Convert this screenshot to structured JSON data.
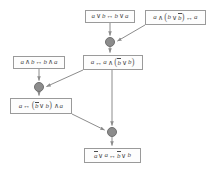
{
  "diagram": {
    "type": "proof-derivation-graph",
    "background_color": "#ffffff",
    "box_border_color": "#9a9a9a",
    "box_fill_color": "#fdfdfd",
    "text_color": "#4a4a4a",
    "node_fill_color": "#8c8c8c",
    "node_border_color": "#6f6f6f",
    "edge_color": "#8c8c8c",
    "formulas": {
      "f1": "a ∨ b ↔ b ∨ a",
      "f2": "a ∧ (b ∨ b̄) ↔ a",
      "f3": "a ↔ a ∧ (b̄ ∨ b)",
      "f4": "a ∧ b ↔ b ∧ a",
      "f5": "a ↔ (b̄ ∨ b) ∧ a",
      "f6": "ā ∨ a ↔ b̄ ∨ b"
    },
    "nodes": [
      {
        "id": "f1",
        "name": "formula-box-avb-bva",
        "label": "a ∨ b ↔ b ∨ a",
        "x": 85,
        "y": 10,
        "w": 50,
        "h": 13
      },
      {
        "id": "f2",
        "name": "formula-box-a-and-bvnb",
        "label": "a ∧ (b ∨ b̄) ↔ a",
        "x": 145,
        "y": 10,
        "w": 61,
        "h": 15
      },
      {
        "id": "f3",
        "name": "formula-box-a-iff-a-and",
        "label": "a ↔ a ∧ (b̄ ∨ b)",
        "x": 83,
        "y": 55,
        "w": 60,
        "h": 15
      },
      {
        "id": "f4",
        "name": "formula-box-aandb-banda",
        "label": "a ∧ b ↔ b ∧ a",
        "x": 13,
        "y": 56,
        "w": 52,
        "h": 13
      },
      {
        "id": "f5",
        "name": "formula-box-a-iff-nbvb-and",
        "label": "a ↔ (b̄ ∨ b) ∧ a",
        "x": 10,
        "y": 98,
        "w": 62,
        "h": 16
      },
      {
        "id": "f6",
        "name": "formula-box-nava-nbvb",
        "label": "ā ∨ a ↔ b̄ ∨ b",
        "x": 84,
        "y": 148,
        "w": 57,
        "h": 15
      }
    ],
    "merge_nodes": [
      {
        "id": "m1",
        "name": "merge-node-top",
        "cx": 110,
        "cy": 42,
        "r": 5
      },
      {
        "id": "m2",
        "name": "merge-node-middle",
        "cx": 39,
        "cy": 87,
        "r": 5
      },
      {
        "id": "m3",
        "name": "merge-node-bottom",
        "cx": 112,
        "cy": 132,
        "r": 5
      }
    ],
    "edges": [
      {
        "name": "edge-f1-to-m1",
        "from": "f1",
        "to": "m1"
      },
      {
        "name": "edge-f2-to-m1",
        "from": "f2",
        "to": "m1"
      },
      {
        "name": "edge-m1-to-f3",
        "from": "m1",
        "to": "f3"
      },
      {
        "name": "edge-f4-to-m2",
        "from": "f4",
        "to": "m2"
      },
      {
        "name": "edge-f3-to-m2",
        "from": "f3",
        "to": "m2"
      },
      {
        "name": "edge-m2-to-f5",
        "from": "m2",
        "to": "f5"
      },
      {
        "name": "edge-f3-to-m3",
        "from": "f3",
        "to": "m3"
      },
      {
        "name": "edge-f5-to-m3",
        "from": "f5",
        "to": "m3"
      },
      {
        "name": "edge-m3-to-f6",
        "from": "m3",
        "to": "f6"
      }
    ]
  }
}
